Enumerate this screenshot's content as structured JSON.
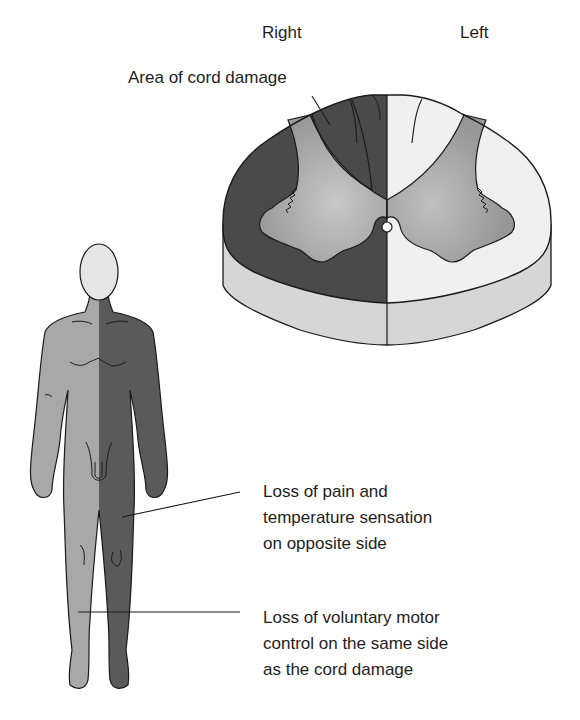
{
  "figure": {
    "side_labels": {
      "right": "Right",
      "left": "Left"
    },
    "callouts": {
      "cord_damage": "Area of cord damage",
      "pain_temperature": "Loss of pain and\ntemperature sensation\non opposite side",
      "motor_control": "Loss of voluntary motor\ncontrol on the same side\nas the cord damage"
    },
    "colors": {
      "damaged": "#4a4a4a",
      "gray_matter": "#9a9a9a",
      "gray_matter_center": "#c4c4c4",
      "white_matter_healthy": "#f0f0f0",
      "cut_side": "#d6d6d6",
      "body_light": "#a8a8a8",
      "body_dark": "#5a5a5a",
      "head": "#e6e6e6",
      "outline": "#1a1a1a"
    }
  }
}
